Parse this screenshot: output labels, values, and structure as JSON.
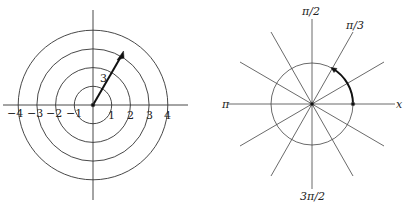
{
  "left_diagram": {
    "title": "Concentric circles r = 1, 2, 3, 4",
    "center": [
      93,
      105
    ],
    "unit_px": 18.7,
    "circle_radii": [
      1,
      2,
      3,
      4
    ],
    "tick_labels_positive": [
      "1",
      "2",
      "3",
      "4"
    ],
    "tick_labels_negative": [
      "−1",
      "−2",
      "−3",
      "−4"
    ],
    "vector_label": "3",
    "vector_angle_deg": 60,
    "vector_length": 3
  },
  "right_diagram": {
    "title": "Radial lines θ = kπ/6 with unit circle",
    "center": [
      312,
      104
    ],
    "circle_radius_px": 41,
    "ray_length_px": 88,
    "ray_angles_deg": [
      0,
      30,
      60,
      90,
      120,
      150
    ],
    "arc_from_deg": 0,
    "arc_to_deg": 60,
    "labels": {
      "top": "π/2",
      "upper_right": "π/3",
      "left": "π",
      "right": "x",
      "bottom": "3π/2"
    }
  },
  "colors": {
    "line": "#333333",
    "bold": "#111111",
    "background": "#ffffff"
  }
}
